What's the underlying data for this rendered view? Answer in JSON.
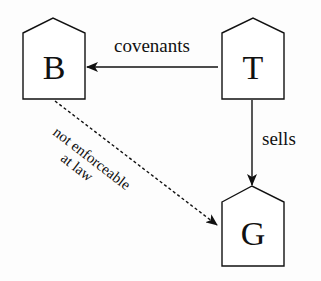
{
  "diagram": {
    "nodes": [
      {
        "id": "B",
        "label": "B"
      },
      {
        "id": "T",
        "label": "T"
      },
      {
        "id": "G",
        "label": "G"
      }
    ],
    "edges": [
      {
        "from": "T",
        "to": "B",
        "label": "covenants",
        "style": "solid"
      },
      {
        "from": "T",
        "to": "G",
        "label": "sells",
        "style": "solid"
      },
      {
        "from": "B",
        "to": "G",
        "label_line1": "not enforceable",
        "label_line2": "at law",
        "style": "dashed"
      }
    ]
  },
  "colors": {
    "stroke": "#111111",
    "background": "#fdfdfd"
  }
}
